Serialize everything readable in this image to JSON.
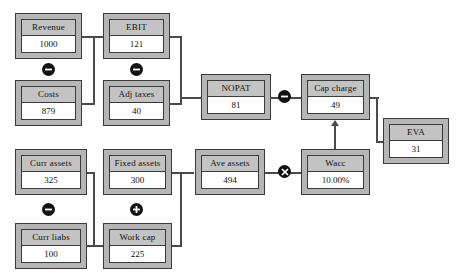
{
  "diagram": {
    "colors": {
      "node_fill": "#b5b5b5",
      "node_label_fill": "#c3c3c3",
      "node_value_fill": "#ffffff",
      "border": "#3a3a3a",
      "connector": "#4a4a4a",
      "operator_badge": "#111111",
      "background": "#ffffff"
    },
    "nodes": [
      {
        "id": "revenue",
        "label": "Revenue",
        "value": "1000"
      },
      {
        "id": "ebit",
        "label": "EBIT",
        "value": "121"
      },
      {
        "id": "costs",
        "label": "Costs",
        "value": "879"
      },
      {
        "id": "adj_taxes",
        "label": "Adj taxes",
        "value": "40"
      },
      {
        "id": "nopat",
        "label": "NOPAT",
        "value": "81"
      },
      {
        "id": "cap_charge",
        "label": "Cap charge",
        "value": "49"
      },
      {
        "id": "eva",
        "label": "EVA",
        "value": "31"
      },
      {
        "id": "curr_assets",
        "label": "Curr assets",
        "value": "325"
      },
      {
        "id": "fixed_assets",
        "label": "Fixed assets",
        "value": "300"
      },
      {
        "id": "ave_assets",
        "label": "Ave assets",
        "value": "494"
      },
      {
        "id": "wacc",
        "label": "Wacc",
        "value": "10.00%"
      },
      {
        "id": "curr_liabs",
        "label": "Curr liabs",
        "value": "100"
      },
      {
        "id": "work_cap",
        "label": "Work cap",
        "value": "225"
      }
    ],
    "operators": [
      {
        "id": "op-revenue-minus-costs",
        "symbol": "minus",
        "name": "minus-operator"
      },
      {
        "id": "op-ebit-minus-adjtaxes",
        "symbol": "minus",
        "name": "minus-operator"
      },
      {
        "id": "op-nopat-minus-capcharge",
        "symbol": "minus",
        "name": "minus-operator"
      },
      {
        "id": "op-currassets-minus-currliabs",
        "symbol": "minus",
        "name": "minus-operator"
      },
      {
        "id": "op-fixedassets-plus-workcap",
        "symbol": "plus",
        "name": "plus-operator"
      },
      {
        "id": "op-aveassets-times-wacc",
        "symbol": "times",
        "name": "multiply-operator"
      }
    ]
  }
}
